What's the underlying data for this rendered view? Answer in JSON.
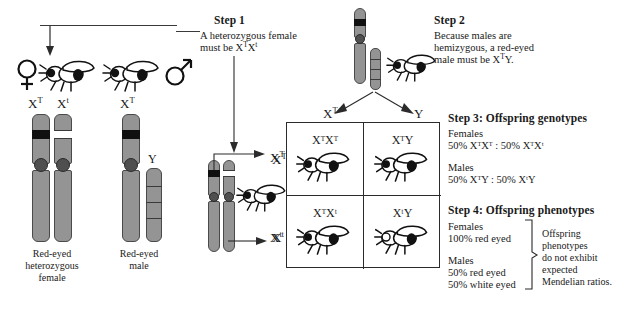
{
  "figure": {
    "title_hidden": "X-linked inheritance Punnett square"
  },
  "steps": {
    "step1": {
      "heading": "Step 1",
      "line1": "A heterozygous female",
      "line2_pre": "must be X",
      "line2_sup1": "T",
      "line2_mid": "X",
      "line2_sup2": "t"
    },
    "step2": {
      "heading": "Step 2",
      "line1": "Because males are",
      "line2": "hemizygous, a red-eyed",
      "line3_pre": "male must be X",
      "line3_sup": "T",
      "line3_post": "Y."
    },
    "step3": {
      "heading": "Step 3: Offspring genotypes",
      "females_label": "Females",
      "females_ratio": "50% XᵀXᵀ : 50% XᵀXᵗ",
      "males_label": "Males",
      "males_ratio": "50% XᵀY : 50% XᵗY"
    },
    "step4": {
      "heading": "Step 4: Offspring phenotypes",
      "females_label": "Females",
      "females_pheno": "100% red eyed",
      "males_label": "Males",
      "males_pheno1": "50% red eyed",
      "males_pheno2": "50% white eyed",
      "note_l1": "Offspring",
      "note_l2": "phenotypes",
      "note_l3": "do not exhibit",
      "note_l4": "expected",
      "note_l5": "Mendelian ratios."
    }
  },
  "parents": {
    "female": {
      "symbol": "♀",
      "allele_left": "X",
      "allele_left_sup": "T",
      "allele_right": "X",
      "allele_right_sup": "t",
      "caption_l1": "Red-eyed",
      "caption_l2": "heterozygous",
      "caption_l3": "female"
    },
    "male": {
      "symbol": "♂",
      "allele": "X",
      "allele_sup": "T",
      "y_label": "Y",
      "caption_l1": "Red-eyed",
      "caption_l2": "male"
    }
  },
  "gametes": {
    "female_top": "X",
    "female_top_sup": "T",
    "female_bottom": "X",
    "female_bottom_sup": "t",
    "male_left": "X",
    "male_left_sup": "T",
    "male_right": "Y"
  },
  "punnett": {
    "col_headers": [
      {
        "base": "X",
        "sup": "T"
      },
      {
        "base": "Y",
        "sup": ""
      }
    ],
    "row_headers": [
      {
        "base": "X",
        "sup": "T"
      },
      {
        "base": "X",
        "sup": "t"
      }
    ],
    "cells": [
      {
        "geno": "XᵀXᵀ",
        "eye": "red",
        "fly": "female"
      },
      {
        "geno": "XᵀY",
        "eye": "red",
        "fly": "male"
      },
      {
        "geno": "XᵀXᵗ",
        "eye": "red",
        "fly": "female"
      },
      {
        "geno": "XᵗY",
        "eye": "white",
        "fly": "male"
      }
    ]
  },
  "colors": {
    "chromosome_body": "#949494",
    "chromosome_outline": "#4a4a4a",
    "band_dominant": "#101010",
    "band_recessive": "#ffffff",
    "centromere": "#4f4f4f",
    "line": "#3a3a3a",
    "text": "#1a1a1a",
    "background": "#ffffff"
  }
}
